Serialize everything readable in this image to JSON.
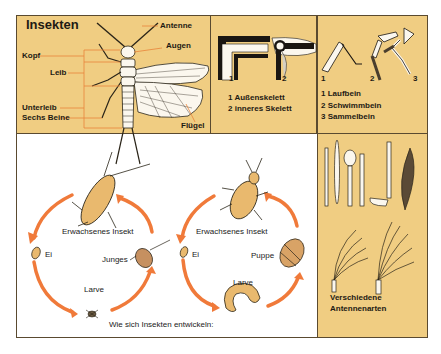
{
  "colors": {
    "panel_bg": "#f0cd82",
    "border": "#5a4a30",
    "arrow": "#f07a3a",
    "leader_line": "#e8843a",
    "insect_fill": "#e9b96e",
    "text": "#1e1a14"
  },
  "anatomy_panel": {
    "title": "Insekten",
    "labels": {
      "antenne": "Antenne",
      "augen": "Augen",
      "kopf": "Kopf",
      "leib": "Leib",
      "unterleib": "Unterleib",
      "beine": "Sechs Beine",
      "fluegel": "Flügel"
    }
  },
  "skeleton_panel": {
    "marker1": "1",
    "marker2": "2",
    "legend": [
      "1 Außenskelett",
      "2 inneres Skelett"
    ]
  },
  "legs_panel": {
    "marker1": "1",
    "marker2": "2",
    "marker3": "3",
    "legend": [
      "1 Laufbein",
      "2 Schwimmbein",
      "3 Sammelbein"
    ]
  },
  "lifecycle": {
    "caption": "Wie sich Insekten entwickeln:",
    "incomplete": {
      "adult": "Erwachsenes Insekt",
      "egg": "Ei",
      "young": "Junges",
      "larva": "Larve"
    },
    "complete": {
      "adult": "Erwachsenes Insekt",
      "egg": "Ei",
      "pupa": "Puppe",
      "larva": "Larve"
    }
  },
  "antenna_panel": {
    "caption_line1": "Verschiedene",
    "caption_line2": "Antennenarten"
  }
}
